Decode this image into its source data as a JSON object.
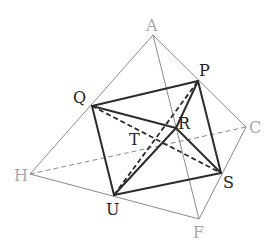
{
  "diagram": {
    "type": "geometry-figure",
    "colors": {
      "outer": "#8a8a8a",
      "outer_label": "#a8a8a8",
      "inner": "#2b2b2b",
      "inner_label": "#222222"
    },
    "points": {
      "A": {
        "label": "A",
        "x": 153,
        "y": 35
      },
      "P": {
        "label": "P",
        "x": 198,
        "y": 81
      },
      "C": {
        "label": "C",
        "x": 246,
        "y": 127
      },
      "Q": {
        "label": "Q",
        "x": 92,
        "y": 106
      },
      "H": {
        "label": "H",
        "x": 30,
        "y": 174
      },
      "S": {
        "label": "S",
        "x": 221,
        "y": 173
      },
      "U": {
        "label": "U",
        "x": 114,
        "y": 195
      },
      "F": {
        "label": "F",
        "x": 199,
        "y": 219
      },
      "R": {
        "label": "R",
        "x": 176,
        "y": 128
      },
      "T": {
        "label": "T",
        "x": 136,
        "y": 151
      }
    },
    "outer_solid_edges": [
      [
        "A",
        "H"
      ],
      [
        "A",
        "C"
      ],
      [
        "A",
        "F"
      ],
      [
        "H",
        "F"
      ],
      [
        "C",
        "F"
      ]
    ],
    "outer_dashed_edges": [
      [
        "H",
        "C"
      ]
    ],
    "inner_solid_edges": [
      [
        "Q",
        "P"
      ],
      [
        "P",
        "S"
      ],
      [
        "S",
        "U"
      ],
      [
        "U",
        "Q"
      ],
      [
        "Q",
        "R"
      ],
      [
        "R",
        "S"
      ],
      [
        "U",
        "R"
      ],
      [
        "R",
        "P"
      ]
    ],
    "inner_dashed_edges": [
      [
        "Q",
        "S"
      ],
      [
        "U",
        "P"
      ]
    ]
  }
}
